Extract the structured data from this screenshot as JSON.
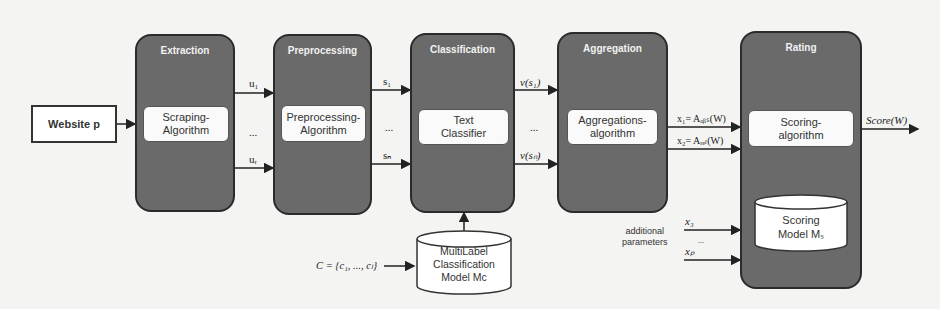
{
  "diagram": {
    "input": {
      "label": "Website p"
    },
    "stages": [
      {
        "id": "extraction",
        "title": "Extraction",
        "algorithm": "Scraping-\nAlgorithm"
      },
      {
        "id": "preprocessing",
        "title": "Preprocessing",
        "algorithm": "Preprocessing-\nAlgorithm"
      },
      {
        "id": "classification",
        "title": "Classification",
        "algorithm": "Text\nClassifier"
      },
      {
        "id": "aggregation",
        "title": "Aggregation",
        "algorithm": "Aggregations-\nalgorithm"
      },
      {
        "id": "rating",
        "title": "Rating",
        "algorithm": "Scoring-\nalgorithm"
      }
    ],
    "edges": {
      "extraction_out": {
        "first": "u₁",
        "dots": "...",
        "last": "uᵣ"
      },
      "preprocessing_out": {
        "first": "s₁",
        "dots": "...",
        "last": "sₙ"
      },
      "classification_out": {
        "first": "v(s₁)",
        "dots": "...",
        "last": "v(sₙ)"
      },
      "aggregation_out": {
        "x1": "x₁= Aₐᵦₛ(W)",
        "x2": "x₂= Aᵣₑₗ(W)"
      },
      "additional": {
        "label": "additional\nparameters",
        "first": "x₃",
        "dots": "...",
        "last": "xₚ"
      },
      "rating_out": {
        "label": "Score(W)"
      }
    },
    "classification_model": {
      "input_label": "C = {c₁, ..., cₗ}",
      "label": "MultiLabel\nClassification\nModel Mᴄ"
    },
    "scoring_model": {
      "label": "Scoring\nModel Mₛ"
    }
  },
  "colors": {
    "stage_fill": "#6a6a6a",
    "stage_border": "#2b2b2b",
    "box_fill": "#fafafa",
    "background": "#f4f4f2"
  }
}
